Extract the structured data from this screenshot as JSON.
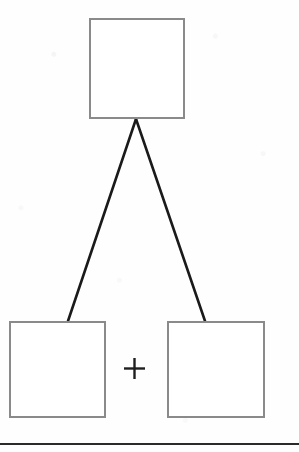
{
  "diagram": {
    "type": "tree",
    "canvas": {
      "width": 299,
      "height": 452,
      "background": "#fefefe"
    },
    "style": {
      "box_border_color": "#8a8a8a",
      "box_border_width": 2,
      "box_fill": "#ffffff",
      "connector_color": "#1a1a1a",
      "connector_width": 2.6,
      "operator_color": "#1f1f1f",
      "page_rule_color": "#2a2a2a"
    },
    "nodes": [
      {
        "id": "whole-box",
        "role": "whole",
        "label": "",
        "x": 89,
        "y": 18,
        "width": 96,
        "height": 101
      },
      {
        "id": "part-box-left",
        "role": "part",
        "label": "",
        "x": 9,
        "y": 321,
        "width": 97,
        "height": 97
      },
      {
        "id": "part-box-right",
        "role": "part",
        "label": "",
        "x": 167,
        "y": 321,
        "width": 98,
        "height": 97
      }
    ],
    "connectors": [
      {
        "id": "branch-left",
        "from": "whole-box",
        "to": "part-box-left",
        "x1": 136,
        "y1": 119,
        "x2": 68,
        "y2": 321
      },
      {
        "id": "branch-right",
        "from": "whole-box",
        "to": "part-box-right",
        "x1": 136,
        "y1": 119,
        "x2": 205,
        "y2": 321
      }
    ],
    "operator": {
      "id": "plus-operator",
      "symbol": "+",
      "center_x": 134,
      "center_y": 368,
      "size": 21,
      "stroke": 2.4
    },
    "page_rule": {
      "y": 443,
      "height": 2
    }
  }
}
